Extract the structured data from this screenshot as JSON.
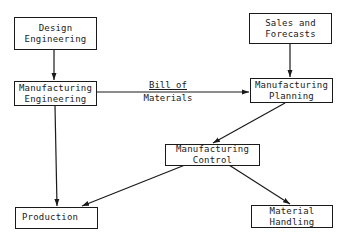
{
  "nodes": {
    "design_engineering": {
      "line1": "Design",
      "line2": "Engineering"
    },
    "manufacturing_engineering": {
      "line1": "Manufacturing",
      "line2": "Engineering"
    },
    "sales_forecasts": {
      "line1": "Sales and",
      "line2": "Forecasts"
    },
    "manufacturing_planning": {
      "line1": "Manufacturing",
      "line2": "Planning"
    },
    "manufacturing_control": {
      "line1": "Manufacturing",
      "line2": "Control"
    },
    "production": {
      "line1": "Production"
    },
    "material_handling": {
      "line1": "Material",
      "line2": "Handling"
    }
  },
  "edges": {
    "bill_of_materials": {
      "line1": "Bill of",
      "line2": "Materials"
    }
  },
  "colors": {
    "stroke": "#1a1a1a",
    "background": "#ffffff"
  }
}
